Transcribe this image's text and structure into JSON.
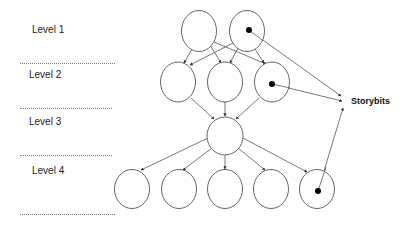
{
  "levels": [
    {
      "label": "Level 1",
      "x": 32,
      "y": 30
    },
    {
      "label": "Level 2",
      "x": 29,
      "y": 75
    },
    {
      "label": "Level 3",
      "x": 29,
      "y": 122
    },
    {
      "label": "Level 4",
      "x": 32,
      "y": 171
    }
  ],
  "separators_y": [
    63,
    108,
    155,
    214
  ],
  "storybits_label": "Storybits",
  "colors": {
    "stroke": "#555555",
    "dot": "#000000"
  },
  "nodes": {
    "l1": [
      {
        "cx": 199,
        "cy": 31,
        "dot": false
      },
      {
        "cx": 247,
        "cy": 31,
        "dot": true
      }
    ],
    "l2": [
      {
        "cx": 178,
        "cy": 82,
        "dot": false
      },
      {
        "cx": 225,
        "cy": 82,
        "dot": false
      },
      {
        "cx": 272,
        "cy": 82,
        "dot": true
      }
    ],
    "l3": [
      {
        "cx": 225,
        "cy": 136,
        "dot": false
      }
    ],
    "l4": [
      {
        "cx": 132,
        "cy": 189,
        "dot": false
      },
      {
        "cx": 179,
        "cy": 189,
        "dot": false
      },
      {
        "cx": 225,
        "cy": 189,
        "dot": false
      },
      {
        "cx": 271,
        "cy": 189,
        "dot": false
      },
      {
        "cx": 317,
        "cy": 189,
        "dot": true
      }
    ]
  }
}
